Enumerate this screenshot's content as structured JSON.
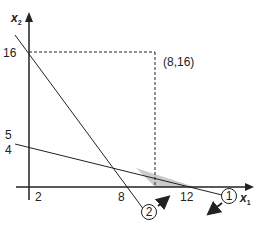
{
  "diagram": {
    "type": "linear-programming-feasible-region",
    "axes": {
      "x_label": "x",
      "x_sub": "1",
      "y_label": "x",
      "y_sub": "2"
    },
    "tick_labels": {
      "y_16": "16",
      "y_5": "5",
      "y_4": "4",
      "x_2": "2",
      "x_8": "8",
      "x_12": "12"
    },
    "point_label": "(8,16)",
    "constraints": [
      {
        "id": "1",
        "label": "1",
        "from": [
          0,
          4.5
        ],
        "to": [
          12,
          0
        ]
      },
      {
        "id": "2",
        "label": "2",
        "from": [
          0,
          16
        ],
        "to": [
          8,
          0
        ]
      }
    ],
    "feasible_region": {
      "shaded": true,
      "fill": "#cccccc",
      "vertices_desc": [
        "intersection of lines 1 and 2",
        "(8,0)",
        "(12,0)"
      ]
    },
    "colors": {
      "line": "#222222",
      "shade": "#cccccc"
    }
  }
}
